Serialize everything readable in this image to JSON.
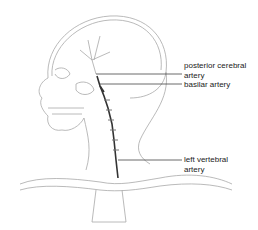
{
  "diagram": {
    "labels": [
      {
        "id": "posterior-cerebral-artery",
        "text": "posterior cerebral\nartery",
        "x": 184,
        "y": 61
      },
      {
        "id": "basilar-artery",
        "text": "basilar artery",
        "x": 184,
        "y": 80
      },
      {
        "id": "left-vertebral-artery",
        "text": "left vertebral\nartery",
        "x": 184,
        "y": 155
      }
    ],
    "leader_lines": [
      {
        "target": "posterior-cerebral-artery",
        "x1": 96,
        "y1": 74,
        "x2": 182,
        "y2": 74
      },
      {
        "target": "basilar-artery",
        "x1": 100,
        "y1": 84,
        "x2": 182,
        "y2": 84
      },
      {
        "target": "left-vertebral-artery",
        "x1": 118,
        "y1": 160,
        "x2": 182,
        "y2": 160
      }
    ],
    "colors": {
      "line": "#444444",
      "sketch": "#9a9a9a",
      "artery": "#333333"
    }
  }
}
